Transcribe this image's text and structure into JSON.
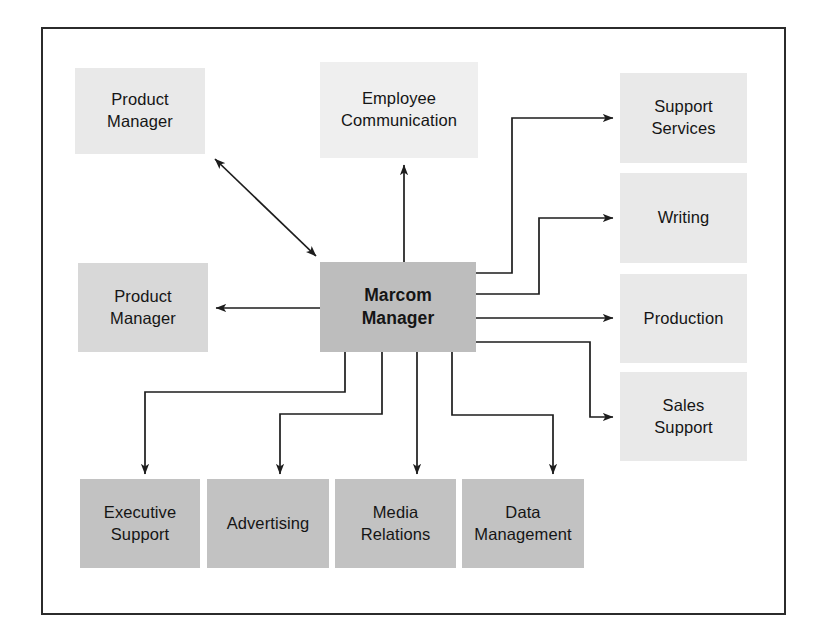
{
  "diagram": {
    "type": "org-relationship-diagram",
    "frame": {
      "border_color": "#2b2b2b",
      "background": "#ffffff"
    },
    "palette": {
      "center_fill": "#bdbdbd",
      "dark_fill": "#c2c2c2",
      "mid_fill": "#d8d8d8",
      "light_fill": "#e9e9e9",
      "lighter_fill": "#efefef",
      "line_color": "#1d1d1d",
      "text_color": "#151515"
    },
    "nodes": [
      {
        "id": "product_manager_top",
        "label": "Product\nManager",
        "line1": "Product",
        "line2": "Manager",
        "fill": "light"
      },
      {
        "id": "employee_communication",
        "label": "Employee\nCommunication",
        "line1": "Employee",
        "line2": "Communication",
        "fill": "lighter"
      },
      {
        "id": "support_services",
        "label": "Support\nServices",
        "line1": "Support",
        "line2": "Services",
        "fill": "light"
      },
      {
        "id": "writing",
        "label": "Writing",
        "line1": "Writing",
        "line2": "",
        "fill": "light"
      },
      {
        "id": "production",
        "label": "Production",
        "line1": "Production",
        "line2": "",
        "fill": "light"
      },
      {
        "id": "sales_support",
        "label": "Sales\nSupport",
        "line1": "Sales",
        "line2": "Support",
        "fill": "light"
      },
      {
        "id": "product_manager_left",
        "label": "Product\nManager",
        "line1": "Product",
        "line2": "Manager",
        "fill": "mid"
      },
      {
        "id": "marcom_manager",
        "label": "Marcom\nManager",
        "line1": "Marcom",
        "line2": "Manager",
        "fill": "center"
      },
      {
        "id": "executive_support",
        "label": "Executive\nSupport",
        "line1": "Executive",
        "line2": "Support",
        "fill": "dark"
      },
      {
        "id": "advertising",
        "label": "Advertising",
        "line1": "Advertising",
        "line2": "",
        "fill": "dark"
      },
      {
        "id": "media_relations",
        "label": "Media\nRelations",
        "line1": "Media",
        "line2": "Relations",
        "fill": "dark"
      },
      {
        "id": "data_management",
        "label": "Data\nManagement",
        "line1": "Data",
        "line2": "Management",
        "fill": "dark"
      }
    ],
    "edges": [
      {
        "from": "marcom_manager",
        "to": "product_manager_top",
        "style": "diagonal",
        "arrows": "both"
      },
      {
        "from": "marcom_manager",
        "to": "employee_communication",
        "style": "straight",
        "arrows": "to"
      },
      {
        "from": "marcom_manager",
        "to": "product_manager_left",
        "style": "straight",
        "arrows": "to"
      },
      {
        "from": "marcom_manager",
        "to": "support_services",
        "style": "orthogonal",
        "arrows": "to"
      },
      {
        "from": "marcom_manager",
        "to": "writing",
        "style": "orthogonal",
        "arrows": "to"
      },
      {
        "from": "marcom_manager",
        "to": "production",
        "style": "straight",
        "arrows": "to"
      },
      {
        "from": "marcom_manager",
        "to": "sales_support",
        "style": "orthogonal",
        "arrows": "to"
      },
      {
        "from": "marcom_manager",
        "to": "executive_support",
        "style": "orthogonal",
        "arrows": "to"
      },
      {
        "from": "marcom_manager",
        "to": "advertising",
        "style": "orthogonal",
        "arrows": "to"
      },
      {
        "from": "marcom_manager",
        "to": "media_relations",
        "style": "straight",
        "arrows": "to"
      },
      {
        "from": "marcom_manager",
        "to": "data_management",
        "style": "orthogonal",
        "arrows": "to"
      }
    ]
  }
}
